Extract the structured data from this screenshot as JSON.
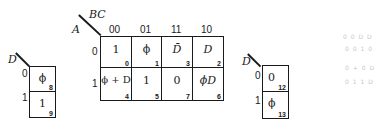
{
  "main_map": {
    "row_var": "A",
    "col_var": "BC",
    "col_headers": [
      "00",
      "01",
      "11",
      "10"
    ],
    "row_headers": [
      "0",
      "1"
    ],
    "cells": [
      [
        {
          "value": "1",
          "index": "0"
        },
        {
          "value": "ϕ",
          "index": "1"
        },
        {
          "value": "D̄",
          "index": "3"
        },
        {
          "value": "D",
          "index": "2"
        }
      ],
      [
        {
          "value": "ϕ + D",
          "index": "4"
        },
        {
          "value": "1",
          "index": "5"
        },
        {
          "value": "0",
          "index": "7"
        },
        {
          "value": "ϕD",
          "index": "6"
        }
      ]
    ]
  },
  "left_map": {
    "var": "D",
    "row_headers": [
      "0",
      "1"
    ],
    "cells": [
      {
        "value": "ϕ",
        "index": "8"
      },
      {
        "value": "1",
        "index": "9"
      }
    ]
  },
  "right_map": {
    "var": "D",
    "row_headers": [
      "0",
      "1"
    ],
    "cells": [
      {
        "value": "0",
        "index": "12"
      },
      {
        "value": "ϕ",
        "index": "13"
      }
    ]
  },
  "bleed_through": [
    "0 0 D D",
    "0 0 1 0",
    "0 + 0 D",
    "0 1 1 D"
  ]
}
